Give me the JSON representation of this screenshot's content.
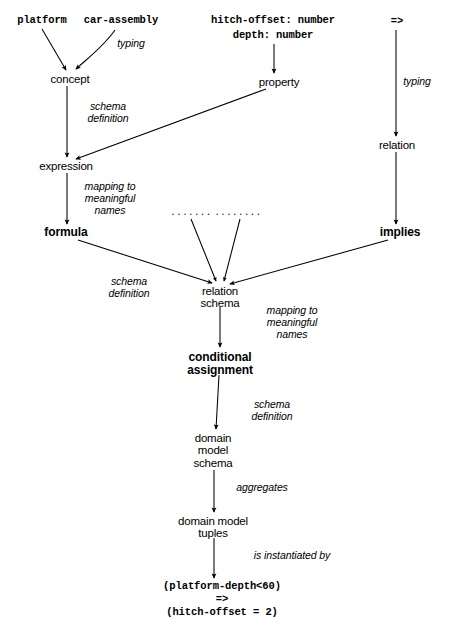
{
  "diagram": {
    "background_color": "#ffffff",
    "ink_color": "#000000",
    "nodes": [
      {
        "id": "platform",
        "label": "platform",
        "style": "mono",
        "x": 42,
        "y": 22
      },
      {
        "id": "car-assembly",
        "label": "car-assembly",
        "style": "mono",
        "x": 121,
        "y": 22
      },
      {
        "id": "hitch-offset-decl",
        "label": "hitch-offset: number",
        "style": "mono",
        "x": 273,
        "y": 22
      },
      {
        "id": "depth-decl",
        "label": "depth: number",
        "style": "mono",
        "x": 273,
        "y": 37
      },
      {
        "id": "arrow-symbol",
        "label": "=>",
        "style": "mono",
        "x": 397,
        "y": 23
      },
      {
        "id": "concept",
        "label": "concept",
        "style": "sans",
        "x": 70,
        "y": 79
      },
      {
        "id": "property",
        "label": "property",
        "style": "sans",
        "x": 279,
        "y": 82
      },
      {
        "id": "relation",
        "label": "relation",
        "style": "sans",
        "x": 397,
        "y": 145
      },
      {
        "id": "expression",
        "label": "expression",
        "style": "sans",
        "x": 66,
        "y": 166
      },
      {
        "id": "formula",
        "label": "formula",
        "style": "sans-bold",
        "x": 66,
        "y": 233
      },
      {
        "id": "implies",
        "label": "implies",
        "style": "sans-bold",
        "x": 400,
        "y": 233
      },
      {
        "id": "relation-schema",
        "label": "relation\nschema",
        "style": "sans",
        "x": 220,
        "y": 291
      },
      {
        "id": "conditional-assignment",
        "label": "conditional\nassignment",
        "style": "sans-bold",
        "x": 220,
        "y": 357
      },
      {
        "id": "domain-model-schema",
        "label": "domain\nmodel\nschema",
        "style": "sans",
        "x": 213,
        "y": 438
      },
      {
        "id": "domain-model-tuples",
        "label": "domain model\ntuples",
        "style": "sans",
        "x": 213,
        "y": 521
      },
      {
        "id": "result-line-1",
        "label": "(platform-depth<60)",
        "style": "mono",
        "x": 222,
        "y": 587
      },
      {
        "id": "result-line-2",
        "label": "=>",
        "style": "mono",
        "x": 222,
        "y": 600
      },
      {
        "id": "result-line-3",
        "label": "(hitch-offset = 2)",
        "style": "mono",
        "x": 222,
        "y": 613
      }
    ],
    "ellipsis_marks": [
      {
        "id": "ellipsis-left",
        "label": ".......",
        "x": 191,
        "y": 212
      },
      {
        "id": "ellipsis-right",
        "label": "........",
        "x": 238,
        "y": 212
      }
    ],
    "edge_labels": [
      {
        "id": "typing-concept",
        "text": "typing",
        "x": 131,
        "y": 44
      },
      {
        "id": "typing-relation",
        "text": "typing",
        "x": 417,
        "y": 82
      },
      {
        "id": "schema-definition-expr",
        "text": "schema\ndefinition",
        "x": 108,
        "y": 108
      },
      {
        "id": "mapping-formula",
        "text": "mapping to\nmeaningful\nnames",
        "x": 110,
        "y": 188
      },
      {
        "id": "schema-definition-rel",
        "text": "schema\ndefinition",
        "x": 129,
        "y": 283
      },
      {
        "id": "mapping-cond-assign",
        "text": "mapping to\nmeaningful\nnames",
        "x": 292,
        "y": 311
      },
      {
        "id": "schema-definition-dms",
        "text": "schema\ndefinition",
        "x": 272,
        "y": 406
      },
      {
        "id": "aggregates",
        "text": "aggregates",
        "x": 262,
        "y": 488
      },
      {
        "id": "is-instantiated-by",
        "text": "is instantiated by",
        "x": 292,
        "y": 556
      }
    ],
    "edges": [
      {
        "id": "platform-to-concept",
        "from": "platform",
        "to": "concept",
        "arrowhead": true
      },
      {
        "id": "car-assembly-to-concept",
        "from": "car-assembly",
        "to": "concept",
        "arrowhead": true
      },
      {
        "id": "decls-to-property",
        "from": "depth-decl",
        "to": "property",
        "arrowhead": true
      },
      {
        "id": "arrow-symbol-to-relation",
        "from": "arrow-symbol",
        "to": "relation",
        "arrowhead": true
      },
      {
        "id": "concept-to-expression",
        "from": "concept",
        "to": "expression",
        "arrowhead": true
      },
      {
        "id": "property-to-expression",
        "from": "property",
        "to": "expression",
        "arrowhead": true
      },
      {
        "id": "relation-to-implies",
        "from": "relation",
        "to": "implies",
        "arrowhead": true
      },
      {
        "id": "expression-to-formula",
        "from": "expression",
        "to": "formula",
        "arrowhead": true
      },
      {
        "id": "formula-to-relation-schema",
        "from": "formula",
        "to": "relation-schema",
        "arrowhead": true
      },
      {
        "id": "implies-to-relation-schema",
        "from": "implies",
        "to": "relation-schema",
        "arrowhead": true
      },
      {
        "id": "ellipsis-left-to-rs",
        "from": "ellipsis-left",
        "to": "relation-schema",
        "arrowhead": true
      },
      {
        "id": "ellipsis-right-to-rs",
        "from": "ellipsis-right",
        "to": "relation-schema",
        "arrowhead": true
      },
      {
        "id": "rs-to-conditional",
        "from": "relation-schema",
        "to": "conditional-assignment",
        "arrowhead": true
      },
      {
        "id": "conditional-to-dms",
        "from": "conditional-assignment",
        "to": "domain-model-schema",
        "arrowhead": true
      },
      {
        "id": "dms-to-tuples",
        "from": "domain-model-schema",
        "to": "domain-model-tuples",
        "arrowhead": true
      },
      {
        "id": "tuples-to-result",
        "from": "domain-model-tuples",
        "to": "result-line-1",
        "arrowhead": true
      }
    ]
  }
}
